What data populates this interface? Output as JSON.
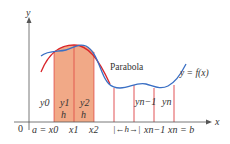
{
  "figure": {
    "axes": {
      "x_label": "x",
      "y_label": "y",
      "origin_label": "0"
    },
    "curve_labels": {
      "function": "y = f(x)",
      "parabola": "Parabola"
    },
    "ordinate_labels": [
      "y0",
      "y1",
      "y2",
      "yn−1",
      "yn"
    ],
    "strip_labels": [
      "h",
      "h"
    ],
    "tick_labels": [
      "a = x0",
      "x1",
      "x2",
      "|←h→|",
      "xn−1",
      "xn = b"
    ],
    "colors": {
      "function_curve": "#3a6fc4",
      "parabola_curve": "#d9262b",
      "shaded_region": "#f0a07a",
      "ordinate_lines": "#d9262b",
      "axes": "#555555"
    }
  }
}
